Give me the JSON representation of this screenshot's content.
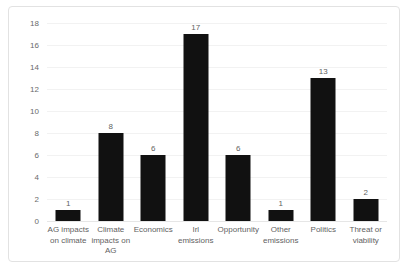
{
  "chart_data": {
    "type": "bar",
    "title": "",
    "subtitle": "",
    "xlabel": "",
    "ylabel": "",
    "categories": [
      "AG impacts on climate",
      "Climate impacts on AG",
      "Economics",
      "Irl emissions",
      "Opportunity",
      "Other emissions",
      "Politics",
      "Threat or viability"
    ],
    "values": [
      1,
      8,
      6,
      17,
      6,
      1,
      13,
      2
    ],
    "data_labels": [
      "1",
      "8",
      "6",
      "17",
      "6",
      "1",
      "13",
      "2"
    ],
    "ylim": [
      0,
      18
    ],
    "ytick_labels": [
      "0",
      "2",
      "4",
      "6",
      "8",
      "10",
      "12",
      "14",
      "16",
      "18"
    ],
    "ytick_values": [
      0,
      2,
      4,
      6,
      8,
      10,
      12,
      14,
      16,
      18
    ],
    "grid": "horizontal",
    "legend": "none",
    "bar_color": "#111111",
    "gridline_color": "#f2f2f2",
    "axis_text_color": "#5f5f5f",
    "plot_border_color": "#e2e2e2",
    "background_color": "#ffffff"
  }
}
